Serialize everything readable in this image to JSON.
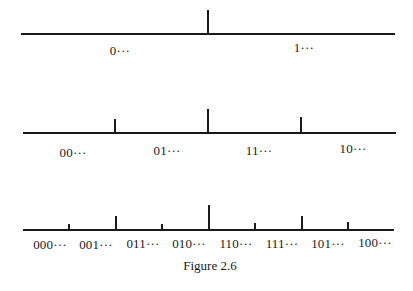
{
  "figure": {
    "caption": "Figure 2.6",
    "rows": [
      {
        "name": "level-1",
        "axis": {
          "x1": 21,
          "x2": 395,
          "y": 34
        },
        "ticks": [
          {
            "x": 208,
            "top": 10,
            "bottom": 35,
            "size": "large"
          }
        ],
        "labels": [
          {
            "text": "0···",
            "x": 120,
            "y": 44
          },
          {
            "text": "1···",
            "x": 304,
            "y": 41
          }
        ]
      },
      {
        "name": "level-2",
        "axis": {
          "x1": 23,
          "x2": 396,
          "y": 133
        },
        "ticks": [
          {
            "x": 115,
            "top": 119,
            "bottom": 134,
            "size": "medium"
          },
          {
            "x": 208,
            "top": 109,
            "bottom": 133,
            "size": "large"
          },
          {
            "x": 301,
            "top": 117,
            "bottom": 132,
            "size": "medium"
          }
        ],
        "labels": [
          {
            "text": "00···",
            "x": 73,
            "y": 146
          },
          {
            "text": "01···",
            "x": 167,
            "y": 144
          },
          {
            "text": "11···",
            "x": 259,
            "y": 144
          },
          {
            "text": "10···",
            "x": 353,
            "y": 142
          }
        ]
      },
      {
        "name": "level-3",
        "axis": {
          "x1": 23,
          "x2": 394,
          "y": 230
        },
        "ticks": [
          {
            "x": 69,
            "top": 224,
            "bottom": 231,
            "size": "small"
          },
          {
            "x": 116,
            "top": 216,
            "bottom": 231,
            "size": "medium"
          },
          {
            "x": 162,
            "top": 224,
            "bottom": 230,
            "size": "small"
          },
          {
            "x": 209,
            "top": 205,
            "bottom": 230,
            "size": "large"
          },
          {
            "x": 255,
            "top": 223,
            "bottom": 230,
            "size": "small"
          },
          {
            "x": 302,
            "top": 216,
            "bottom": 230,
            "size": "medium"
          },
          {
            "x": 348,
            "top": 222,
            "bottom": 229,
            "size": "small"
          }
        ],
        "labels": [
          {
            "text": "000···",
            "x": 50,
            "y": 238
          },
          {
            "text": "001···",
            "x": 96,
            "y": 238
          },
          {
            "text": "011···",
            "x": 143,
            "y": 237
          },
          {
            "text": "010···",
            "x": 189,
            "y": 237
          },
          {
            "text": "110···",
            "x": 236,
            "y": 237
          },
          {
            "text": "111···",
            "x": 282,
            "y": 237
          },
          {
            "text": "101···",
            "x": 328,
            "y": 237
          },
          {
            "text": "100···",
            "x": 375,
            "y": 236
          }
        ]
      }
    ]
  },
  "colors": {
    "ink": "#1a1a1a",
    "background": "#ffffff"
  }
}
